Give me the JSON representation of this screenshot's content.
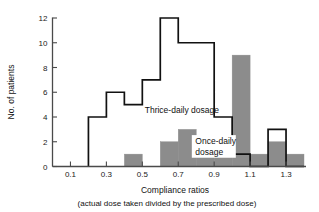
{
  "chart_data": {
    "type": "bar",
    "title": "",
    "xlabel": "Compliance ratios",
    "xlabel_sub": "(actual dose taken divided by the prescribed dose)",
    "ylabel": "No. of patients",
    "xlim": [
      0.0,
      1.4
    ],
    "ylim": [
      0,
      12
    ],
    "grid": false,
    "legend_position": "inline-annotation",
    "xticks": [
      0.1,
      0.3,
      0.5,
      0.7,
      0.9,
      1.1,
      1.3
    ],
    "xtick_labels": [
      "0.1",
      "0.3",
      "0.5",
      "0.7",
      "0.9",
      "1.1",
      "1.3"
    ],
    "yticks": [
      0,
      2,
      4,
      6,
      8,
      10,
      12
    ],
    "ytick_labels": [
      "0",
      "2",
      "4",
      "6",
      "8",
      "10",
      "12"
    ],
    "bin_edges": [
      0.0,
      0.1,
      0.2,
      0.3,
      0.4,
      0.5,
      0.6,
      0.7,
      0.8,
      0.9,
      1.0,
      1.1,
      1.2,
      1.3,
      1.4
    ],
    "series": [
      {
        "name": "Thrice-daily dosage",
        "style": "outline",
        "color": "#ffffff",
        "edge_color": "#111111",
        "values": [
          0,
          0,
          4,
          6,
          5,
          7,
          12,
          10,
          10,
          4,
          1,
          0,
          3,
          0
        ]
      },
      {
        "name": "Once-daily dosage",
        "style": "filled",
        "color": "#8c8c8c",
        "edge_color": "#8c8c8c",
        "values": [
          0,
          0,
          0,
          0,
          1,
          0,
          2,
          3,
          2,
          2,
          9,
          1,
          2,
          1
        ]
      }
    ],
    "annotations": [
      {
        "text": "Thrice-daily dosage",
        "x": 0.72,
        "y": 4.35
      },
      {
        "text": "Once-daily",
        "x": 0.795,
        "y": 1.85
      },
      {
        "text": "dosage",
        "x": 0.795,
        "y": 0.95
      }
    ]
  },
  "colors": {
    "fill_gray": "#8c8c8c",
    "outline": "#111111",
    "axis": "#4a4a4a",
    "background": "#ffffff"
  }
}
